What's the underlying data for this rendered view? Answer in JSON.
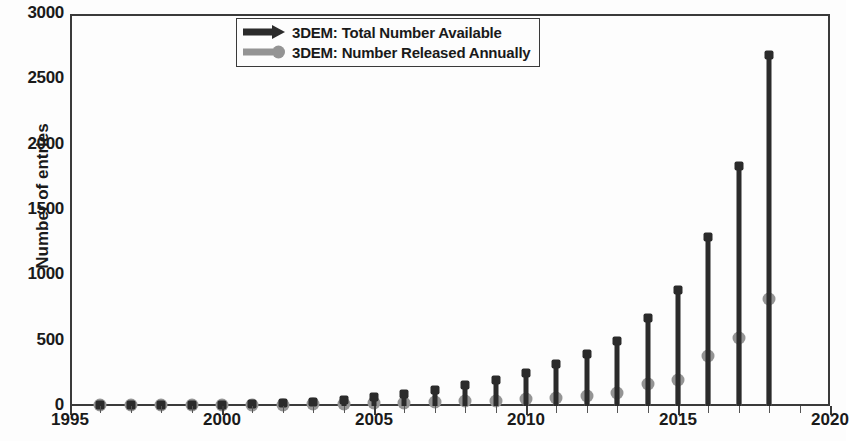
{
  "chart_data": {
    "type": "line",
    "title": "",
    "xlabel": "",
    "ylabel": "Number of entries",
    "xlim": [
      1995,
      2020
    ],
    "ylim": [
      0,
      3000
    ],
    "xticks": [
      1995,
      2000,
      2005,
      2010,
      2015,
      2020
    ],
    "yticks": [
      0,
      500,
      1000,
      1500,
      2000,
      2500,
      3000
    ],
    "grid": false,
    "legend_position": "top-center",
    "x": [
      1996,
      1997,
      1998,
      1999,
      2000,
      2001,
      2002,
      2003,
      2004,
      2005,
      2006,
      2007,
      2008,
      2009,
      2010,
      2011,
      2012,
      2013,
      2014,
      2015,
      2016,
      2017,
      2018
    ],
    "series": [
      {
        "name": "3DEM: Total Number Available",
        "marker": "arrow",
        "color": "#2b2b2b",
        "values": [
          2,
          3,
          5,
          7,
          10,
          14,
          20,
          32,
          48,
          70,
          95,
          125,
          160,
          200,
          255,
          320,
          400,
          500,
          670,
          890,
          1290,
          1840,
          2690
        ]
      },
      {
        "name": "3DEM: Number Released Annually",
        "marker": "circle",
        "color": "#949494",
        "values": [
          2,
          1,
          2,
          2,
          3,
          4,
          6,
          12,
          16,
          22,
          25,
          30,
          35,
          40,
          55,
          65,
          80,
          100,
          170,
          200,
          380,
          520,
          820
        ]
      }
    ]
  },
  "legend": {
    "entries": [
      {
        "label": "3DEM: Total Number Available"
      },
      {
        "label": "3DEM: Number Released Annually"
      }
    ]
  },
  "axes": {
    "y_label": "Number of entries",
    "y_tick_labels": [
      "0",
      "500",
      "1000",
      "1500",
      "2000",
      "2500",
      "3000"
    ],
    "x_tick_labels": [
      "1995",
      "2000",
      "2005",
      "2010",
      "2015",
      "2020"
    ]
  },
  "colors": {
    "total": "#2b2b2b",
    "annual": "#949494",
    "axis": "#3a3a3a",
    "background": "#fdfdfd",
    "text": "#1a1a1a"
  }
}
